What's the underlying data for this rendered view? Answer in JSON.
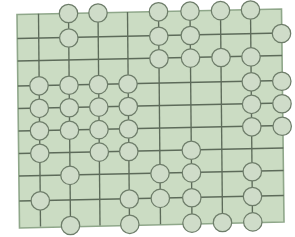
{
  "figure": {
    "type": "lattice-diagram",
    "width": 295,
    "height": 237
  },
  "colors": {
    "background": "#ffffff",
    "panel_fill": "#cbdcc3",
    "panel_border": "#8fa78a",
    "grid_line": "#5d6b5a",
    "node_fill": "#cfdcc9",
    "node_stroke": "#6e7d6a"
  },
  "style": {
    "grid_line_width": 1.35,
    "panel_border_width": 1.6,
    "node_radius": 9.2,
    "node_stroke_width": 1.25
  },
  "panel": {
    "corners": [
      [
        17.0,
        14.5
      ],
      [
        281.5,
        9.0
      ],
      [
        284.0,
        222.0
      ],
      [
        19.5,
        228.0
      ]
    ]
  },
  "chart_data": {
    "type": "scatter",
    "xlabel": "",
    "ylabel": "",
    "grid": true,
    "legend": null,
    "columns": [
      {
        "name": "c0",
        "x": 18.0
      },
      {
        "name": "c1",
        "x": 38.0
      },
      {
        "name": "c2",
        "x": 68.0
      },
      {
        "name": "c3",
        "x": 97.5
      },
      {
        "name": "c4",
        "x": 127.0
      },
      {
        "name": "c5",
        "x": 158.0
      },
      {
        "name": "c6",
        "x": 190.0
      },
      {
        "name": "c7",
        "x": 220.0
      },
      {
        "name": "c8",
        "x": 250.0
      },
      {
        "name": "c9",
        "x": 281.0
      }
    ],
    "rows": [
      {
        "name": "r0",
        "y": 13.0
      },
      {
        "name": "r1",
        "y": 37.5
      },
      {
        "name": "r2",
        "y": 60.0
      },
      {
        "name": "r3",
        "y": 85.0
      },
      {
        "name": "r4",
        "y": 107.5
      },
      {
        "name": "r5",
        "y": 130.0
      },
      {
        "name": "r6",
        "y": 152.5
      },
      {
        "name": "r7",
        "y": 175.0
      },
      {
        "name": "r8",
        "y": 200.0
      },
      {
        "name": "r9",
        "y": 223.0
      }
    ],
    "vertical_lines": [
      {
        "col": "c1",
        "x_top": 38.5,
        "y_top": 13.8,
        "x_bottom": 40.5,
        "y_bottom": 226.5
      },
      {
        "col": "c2",
        "x_top": 68.5,
        "y_top": 13.2,
        "x_bottom": 70.5,
        "y_bottom": 226.0
      },
      {
        "col": "c3",
        "x_top": 98.0,
        "y_top": 12.6,
        "x_bottom": 100.0,
        "y_bottom": 225.4
      },
      {
        "col": "c4",
        "x_top": 127.5,
        "y_top": 12.0,
        "x_bottom": 129.5,
        "y_bottom": 224.8
      },
      {
        "col": "c5",
        "x_top": 158.5,
        "y_top": 11.4,
        "x_bottom": 160.5,
        "y_bottom": 224.2
      },
      {
        "col": "c6",
        "x_top": 190.0,
        "y_top": 10.8,
        "x_bottom": 192.0,
        "y_bottom": 223.6
      },
      {
        "col": "c7",
        "x_top": 220.5,
        "y_top": 10.2,
        "x_bottom": 222.5,
        "y_bottom": 223.0
      },
      {
        "col": "c8",
        "x_top": 250.5,
        "y_top": 9.6,
        "x_bottom": 252.5,
        "y_bottom": 222.5
      }
    ],
    "horizontal_lines": [
      {
        "row": "r1",
        "x_left": 17.3,
        "y_left": 38.5,
        "x_right": 281.8,
        "y_right": 33.0
      },
      {
        "row": "r2",
        "x_left": 17.6,
        "y_left": 61.0,
        "x_right": 282.1,
        "y_right": 55.5
      },
      {
        "row": "r3",
        "x_left": 17.9,
        "y_left": 86.0,
        "x_right": 282.4,
        "y_right": 80.5
      },
      {
        "row": "r4",
        "x_left": 18.2,
        "y_left": 108.5,
        "x_right": 282.7,
        "y_right": 103.0
      },
      {
        "row": "r5",
        "x_left": 18.5,
        "y_left": 131.0,
        "x_right": 283.0,
        "y_right": 125.5
      },
      {
        "row": "r6",
        "x_left": 18.8,
        "y_left": 153.5,
        "x_right": 283.3,
        "y_right": 148.0
      },
      {
        "row": "r7",
        "x_left": 19.0,
        "y_left": 176.0,
        "x_right": 283.5,
        "y_right": 170.5
      },
      {
        "row": "r8",
        "x_left": 19.3,
        "y_left": 201.0,
        "x_right": 283.8,
        "y_right": 195.5
      }
    ],
    "nodes": [
      {
        "id": "n1",
        "col": "c2",
        "row": "r0",
        "x": 68.5,
        "y": 13.5
      },
      {
        "id": "n2",
        "col": "c3",
        "row": "r0",
        "x": 98.0,
        "y": 13.0
      },
      {
        "id": "n3",
        "col": "c5",
        "row": "r0",
        "x": 158.5,
        "y": 11.8
      },
      {
        "id": "n4",
        "col": "c6",
        "row": "r0",
        "x": 190.0,
        "y": 11.2
      },
      {
        "id": "n5",
        "col": "c7",
        "row": "r0",
        "x": 220.5,
        "y": 10.6
      },
      {
        "id": "n6",
        "col": "c8",
        "row": "r0",
        "x": 250.5,
        "y": 10.0
      },
      {
        "id": "n7",
        "col": "c2",
        "row": "r1",
        "x": 68.8,
        "y": 38.0
      },
      {
        "id": "n8",
        "col": "c5",
        "row": "r1",
        "x": 158.8,
        "y": 36.2
      },
      {
        "id": "n9",
        "col": "c6",
        "row": "r1",
        "x": 190.3,
        "y": 35.5
      },
      {
        "id": "n10",
        "col": "c9",
        "row": "r1",
        "x": 281.5,
        "y": 33.5
      },
      {
        "id": "n11",
        "col": "c5",
        "row": "r2",
        "x": 159.0,
        "y": 58.8
      },
      {
        "id": "n12",
        "col": "c6",
        "row": "r2",
        "x": 190.5,
        "y": 58.1
      },
      {
        "id": "n13",
        "col": "c7",
        "row": "r2",
        "x": 221.0,
        "y": 57.5
      },
      {
        "id": "n14",
        "col": "c8",
        "row": "r2",
        "x": 251.0,
        "y": 56.9
      },
      {
        "id": "n15",
        "col": "c1",
        "row": "r3",
        "x": 39.0,
        "y": 85.8
      },
      {
        "id": "n16",
        "col": "c2",
        "row": "r3",
        "x": 69.0,
        "y": 85.2
      },
      {
        "id": "n17",
        "col": "c3",
        "row": "r3",
        "x": 98.5,
        "y": 84.6
      },
      {
        "id": "n18",
        "col": "c4",
        "row": "r3",
        "x": 128.0,
        "y": 84.0
      },
      {
        "id": "n19",
        "col": "c8",
        "row": "r3",
        "x": 251.3,
        "y": 81.8
      },
      {
        "id": "n20",
        "col": "c9",
        "row": "r3",
        "x": 281.8,
        "y": 81.2
      },
      {
        "id": "n21",
        "col": "c1",
        "row": "r4",
        "x": 39.3,
        "y": 108.3
      },
      {
        "id": "n22",
        "col": "c2",
        "row": "r4",
        "x": 69.3,
        "y": 107.7
      },
      {
        "id": "n23",
        "col": "c3",
        "row": "r4",
        "x": 98.8,
        "y": 107.1
      },
      {
        "id": "n24",
        "col": "c4",
        "row": "r4",
        "x": 128.3,
        "y": 106.5
      },
      {
        "id": "n25",
        "col": "c8",
        "row": "r4",
        "x": 251.6,
        "y": 104.3
      },
      {
        "id": "n26",
        "col": "c9",
        "row": "r4",
        "x": 282.0,
        "y": 103.7
      },
      {
        "id": "n27",
        "col": "c1",
        "row": "r5",
        "x": 39.5,
        "y": 130.8
      },
      {
        "id": "n28",
        "col": "c2",
        "row": "r5",
        "x": 69.5,
        "y": 130.2
      },
      {
        "id": "n29",
        "col": "c3",
        "row": "r5",
        "x": 99.0,
        "y": 129.6
      },
      {
        "id": "n30",
        "col": "c4",
        "row": "r5",
        "x": 128.5,
        "y": 129.0
      },
      {
        "id": "n31",
        "col": "c8",
        "row": "r5",
        "x": 251.8,
        "y": 126.8
      },
      {
        "id": "n32",
        "col": "c9",
        "row": "r5",
        "x": 282.2,
        "y": 126.2
      },
      {
        "id": "n33",
        "col": "c1",
        "row": "r6",
        "x": 39.8,
        "y": 153.3
      },
      {
        "id": "n34",
        "col": "c3",
        "row": "r6",
        "x": 99.3,
        "y": 152.1
      },
      {
        "id": "n35",
        "col": "c4",
        "row": "r6",
        "x": 128.8,
        "y": 151.5
      },
      {
        "id": "n36",
        "col": "c6",
        "row": "r6",
        "x": 191.3,
        "y": 150.2
      },
      {
        "id": "n37",
        "col": "c2",
        "row": "r7",
        "x": 70.0,
        "y": 175.4
      },
      {
        "id": "n38",
        "col": "c5",
        "row": "r7",
        "x": 160.0,
        "y": 173.6
      },
      {
        "id": "n39",
        "col": "c6",
        "row": "r7",
        "x": 191.5,
        "y": 172.9
      },
      {
        "id": "n40",
        "col": "c8",
        "row": "r7",
        "x": 252.3,
        "y": 171.7
      },
      {
        "id": "n41",
        "col": "c1",
        "row": "r8",
        "x": 40.3,
        "y": 200.8
      },
      {
        "id": "n42",
        "col": "c4",
        "row": "r8",
        "x": 129.3,
        "y": 199.0
      },
      {
        "id": "n43",
        "col": "c5",
        "row": "r8",
        "x": 160.3,
        "y": 198.4
      },
      {
        "id": "n44",
        "col": "c6",
        "row": "r8",
        "x": 191.8,
        "y": 197.7
      },
      {
        "id": "n45",
        "col": "c8",
        "row": "r8",
        "x": 252.5,
        "y": 196.5
      },
      {
        "id": "n46",
        "col": "c2",
        "row": "r9",
        "x": 70.5,
        "y": 225.5
      },
      {
        "id": "n47",
        "col": "c4",
        "row": "r9",
        "x": 129.8,
        "y": 224.3
      },
      {
        "id": "n48",
        "col": "c6",
        "row": "r9",
        "x": 192.0,
        "y": 223.1
      },
      {
        "id": "n49",
        "col": "c7",
        "row": "r9",
        "x": 222.5,
        "y": 222.5
      },
      {
        "id": "n50",
        "col": "c8",
        "row": "r9",
        "x": 252.8,
        "y": 221.9
      }
    ],
    "node_count": 50,
    "column_count": 10,
    "row_count": 10
  }
}
